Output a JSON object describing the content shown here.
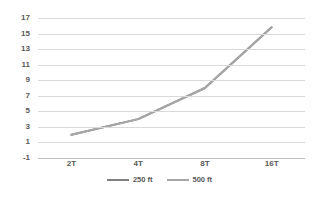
{
  "chart_data": {
    "type": "line",
    "title": "",
    "subtitle": "",
    "xlabel": "",
    "ylabel": "",
    "categories": [
      "2T",
      "4T",
      "8T",
      "16T"
    ],
    "series": [
      {
        "name": "250 ft",
        "color": "#808080",
        "values": [
          2,
          4,
          8,
          15.8
        ]
      },
      {
        "name": "500 ft",
        "color": "#a6a6a6",
        "values": [
          2,
          4,
          8,
          15.8
        ]
      }
    ],
    "ylim": [
      -1,
      17
    ],
    "yticks": [
      17,
      15,
      13,
      11,
      9,
      7,
      5,
      3,
      1,
      -1
    ],
    "grid": true,
    "grid_color": "#d9d9d9",
    "legend_position": "bottom"
  },
  "legend": {
    "items": [
      {
        "label": "250 ft",
        "color": "#808080"
      },
      {
        "label": "500 ft",
        "color": "#a6a6a6"
      }
    ]
  },
  "axes": {
    "y_tick_labels": [
      "17",
      "15",
      "13",
      "11",
      "9",
      "7",
      "5",
      "3",
      "1",
      "-1"
    ],
    "x_tick_labels": [
      "2T",
      "4T",
      "8T",
      "16T"
    ]
  }
}
